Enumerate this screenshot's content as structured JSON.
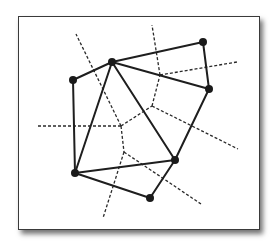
{
  "diagram": {
    "type": "delaunay-voronoi",
    "colors": {
      "frame_border": "#3a3a3a",
      "edges": "#1e1e1e",
      "sites": "#1a1a1a",
      "background": "#ffffff"
    },
    "sites": [
      {
        "id": "A",
        "x": 112,
        "y": 62
      },
      {
        "id": "B",
        "x": 73,
        "y": 80
      },
      {
        "id": "C",
        "x": 203,
        "y": 42
      },
      {
        "id": "D",
        "x": 209,
        "y": 89
      },
      {
        "id": "E",
        "x": 175,
        "y": 160
      },
      {
        "id": "F",
        "x": 75,
        "y": 173
      },
      {
        "id": "G",
        "x": 150,
        "y": 198
      }
    ],
    "delaunay_edges": [
      [
        "A",
        "B"
      ],
      [
        "A",
        "C"
      ],
      [
        "A",
        "D"
      ],
      [
        "A",
        "E"
      ],
      [
        "A",
        "F"
      ],
      [
        "B",
        "F"
      ],
      [
        "C",
        "D"
      ],
      [
        "D",
        "E"
      ],
      [
        "E",
        "F"
      ],
      [
        "F",
        "G"
      ],
      [
        "E",
        "G"
      ]
    ],
    "voronoi_vertices": [
      {
        "id": "V1",
        "x": 121,
        "y": 126
      },
      {
        "id": "V2",
        "x": 152,
        "y": 106
      },
      {
        "id": "V3",
        "x": 124,
        "y": 152
      },
      {
        "id": "V4",
        "x": 160,
        "y": 75
      }
    ],
    "voronoi_edges": [
      [
        [
          121,
          126
        ],
        [
          152,
          106
        ]
      ],
      [
        [
          121,
          126
        ],
        [
          124,
          152
        ]
      ],
      [
        [
          152,
          106
        ],
        [
          160,
          75
        ]
      ],
      [
        [
          121,
          126
        ],
        [
          76,
          34
        ]
      ],
      [
        [
          121,
          126
        ],
        [
          37,
          126
        ]
      ],
      [
        [
          160,
          75
        ],
        [
          152,
          25
        ]
      ],
      [
        [
          160,
          75
        ],
        [
          237,
          62
        ]
      ],
      [
        [
          152,
          106
        ],
        [
          238,
          149
        ]
      ],
      [
        [
          124,
          152
        ],
        [
          201,
          204
        ]
      ],
      [
        [
          124,
          152
        ],
        [
          103,
          218
        ]
      ]
    ]
  }
}
